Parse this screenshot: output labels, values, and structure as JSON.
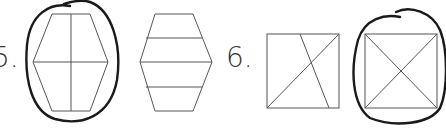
{
  "problems": [
    {
      "number_label": "5.",
      "options": [
        {
          "shape": "hexagon",
          "division": "quarters (one vertical + one horizontal line)",
          "circled": true
        },
        {
          "shape": "hexagon",
          "division": "four horizontal bands",
          "circled": false
        }
      ]
    },
    {
      "number_label": "6.",
      "options": [
        {
          "shape": "square",
          "division": "one diagonal + one slanted line (unequal parts)",
          "circled": false
        },
        {
          "shape": "square",
          "division": "two diagonals (four equal triangles)",
          "circled": true
        }
      ]
    }
  ],
  "colors": {
    "shape_stroke": "#555555",
    "circle_stroke": "#1a1a1a",
    "background": "#ffffff"
  }
}
